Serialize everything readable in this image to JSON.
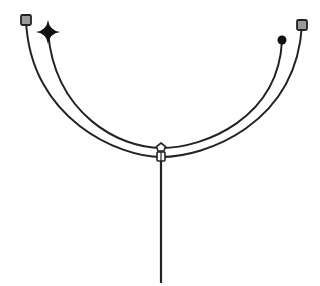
{
  "diagram": {
    "width": 320,
    "height": 286,
    "background": "#ffffff",
    "stroke_color": "#222222",
    "marker_fill": "#9a9a9a",
    "outer_arc": {
      "start": [
        26,
        20
      ],
      "control1": [
        30,
        120
      ],
      "control2": [
        120,
        157
      ],
      "mid": [
        161,
        157
      ],
      "control3": [
        205,
        157
      ],
      "control4": [
        296,
        125
      ],
      "end": [
        302,
        25
      ],
      "start_marker": "square",
      "end_marker": "square"
    },
    "inner_arc": {
      "start": [
        48,
        32
      ],
      "control1": [
        55,
        115
      ],
      "control2": [
        120,
        148
      ],
      "mid": [
        161,
        148
      ],
      "control3": [
        205,
        148
      ],
      "control4": [
        278,
        118
      ],
      "end": [
        282,
        41
      ],
      "start_marker": "four-point-star",
      "end_marker": "dot"
    },
    "junction": {
      "x": 161,
      "pentagon_y": 148,
      "rect_y": 156
    },
    "stem": {
      "x": 161,
      "y_top": 160,
      "y_bottom": 283
    }
  }
}
